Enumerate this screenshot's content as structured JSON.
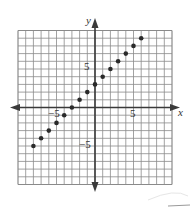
{
  "chart_data": {
    "type": "scatter",
    "title": "",
    "xlabel": "x",
    "ylabel": "y",
    "xlim": [
      -10,
      10
    ],
    "ylim": [
      -10,
      10
    ],
    "grid": true,
    "grid_step": 1,
    "x_tick_labels": [
      {
        "value": -5,
        "text": "−5"
      },
      {
        "value": 5,
        "text": "5"
      }
    ],
    "y_tick_labels": [
      {
        "value": 5,
        "text": "5"
      },
      {
        "value": -5,
        "text": "−5"
      }
    ],
    "series": [
      {
        "name": "points",
        "x": [
          -8,
          -7,
          -6,
          -5,
          -4,
          -3,
          -2,
          -1,
          0,
          1,
          2,
          3,
          4,
          5,
          6
        ],
        "y": [
          -5,
          -4,
          -3,
          -2,
          -1,
          0,
          1,
          2,
          3,
          4,
          5,
          6,
          7,
          8,
          9
        ]
      }
    ]
  },
  "labels": {
    "x_axis": "x",
    "y_axis": "y",
    "x_neg5": "−5",
    "x_pos5": "5",
    "y_pos5": "5",
    "y_neg5": "−5"
  },
  "colors": {
    "grid": "#8a8a8a",
    "axis": "#3a3a3a",
    "point": "#2a2a2a"
  }
}
